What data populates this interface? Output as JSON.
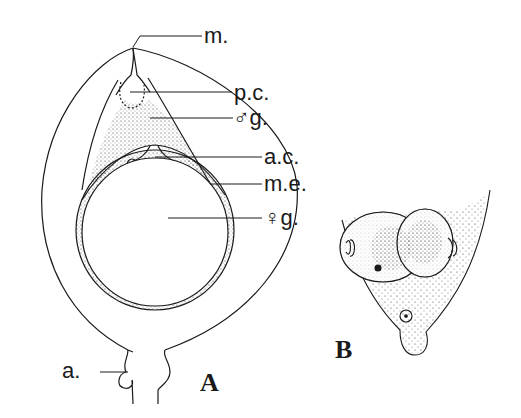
{
  "figure_a": {
    "panel_label": "A",
    "labels": {
      "micropyle": "m.",
      "pollen_chamber": "p.c.",
      "male_gametophyte": "♂g.",
      "archegonial_chamber": "a.c.",
      "megaspore_membrane": "m.e.",
      "female_gametophyte": "♀g.",
      "attachment": "a."
    }
  },
  "figure_b": {
    "panel_label": "B"
  },
  "colors": {
    "ink": "#1a1a1a",
    "background": "#ffffff"
  }
}
